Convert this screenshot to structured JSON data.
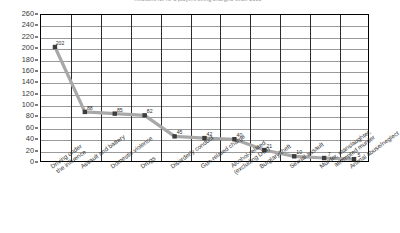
{
  "chart_data": {
    "type": "line",
    "title": "Reasons for NFL players being charged since 2000",
    "xlabel": "",
    "ylabel": "",
    "ylim": [
      0,
      260
    ],
    "ytick_step": 20,
    "grid": true,
    "legend": "none",
    "marker": "square",
    "line_color": "#a0a0a0",
    "marker_color": "#3d3d3d",
    "grid_color": "#9a9a9a",
    "axis_color": "#000000",
    "categories": [
      "Driving under the influence",
      "Assault and battery",
      "Domestic violence",
      "Drugs",
      "Disorderly conduct",
      "Gun-related charge",
      "Alcohol-related (excluding DUI)",
      "Burglary/theft",
      "Sexual assault",
      "Murder, manslaughter, attempted murder",
      "Animal abuse/neglect"
    ],
    "category_lines": [
      [
        "Driving under",
        "the influence"
      ],
      [
        "Assault and battery"
      ],
      [
        "Domestic violence"
      ],
      [
        "Drugs"
      ],
      [
        "Disorderly conduct"
      ],
      [
        "Gun-related charge"
      ],
      [
        "Alcohol-related",
        "(excluding DUI)"
      ],
      [
        "Burglary/theft"
      ],
      [
        "Sexual assault"
      ],
      [
        "Murder, manslaughter,",
        "attempted murder"
      ],
      [
        "Animal abuse/neglect"
      ]
    ],
    "values": [
      202,
      88,
      85,
      82,
      45,
      42,
      40,
      21,
      10,
      7,
      5
    ],
    "point_labels": [
      "202",
      "88",
      "85",
      "82",
      "45",
      "42",
      "40",
      "21",
      "10",
      "7",
      "5"
    ],
    "yticks": [
      0,
      20,
      40,
      60,
      80,
      100,
      120,
      140,
      160,
      180,
      200,
      220,
      240,
      260
    ],
    "ytick_labels": [
      "0",
      "20",
      "40",
      "60",
      "80",
      "100",
      "120",
      "140",
      "160",
      "180",
      "200",
      "220",
      "240",
      "260"
    ]
  }
}
